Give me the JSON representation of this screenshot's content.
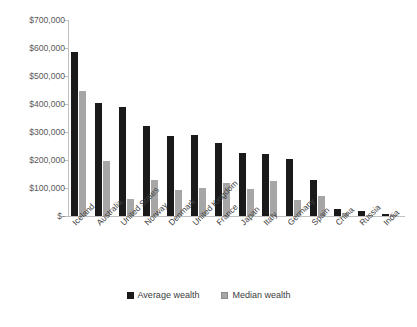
{
  "chart_data": {
    "type": "bar",
    "title": "",
    "subtitle": "",
    "xlabel": "",
    "ylabel": "",
    "ylim": [
      0,
      700000
    ],
    "grid": false,
    "legend_position": "bottom",
    "y_tick_labels": [
      "$700,000",
      "$600,000",
      "$500,000",
      "$400,000",
      "$300,000",
      "$200,000",
      "$100,000",
      "$-"
    ],
    "y_tick_values": [
      700000,
      600000,
      500000,
      400000,
      300000,
      200000,
      100000,
      0
    ],
    "categories": [
      "Iceland",
      "Australia",
      "United States",
      "Norway",
      "Denmark",
      "United Kingdom",
      "France",
      "Japan",
      "Italy",
      "Germany",
      "Spain",
      "China",
      "Russia",
      "India"
    ],
    "series": [
      {
        "name": "Average wealth",
        "color": "#1a1a1a",
        "values": [
          586000,
          404000,
          389000,
          321000,
          286000,
          290000,
          262000,
          225000,
          220000,
          203000,
          129000,
          26000,
          18000,
          8000
        ]
      },
      {
        "name": "Median wealth",
        "color": "#a6a6a6",
        "values": [
          445000,
          195000,
          62000,
          130000,
          92000,
          100000,
          118000,
          97000,
          125000,
          58000,
          73000,
          11000,
          3000,
          2000
        ]
      }
    ]
  },
  "legend": {
    "items": [
      {
        "label": "Average wealth",
        "swatch": "black-square-icon"
      },
      {
        "label": "Median wealth",
        "swatch": "gray-square-icon"
      }
    ]
  }
}
